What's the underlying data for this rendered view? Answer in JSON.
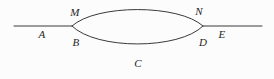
{
  "figure": {
    "kind": "graph-diagram",
    "background_color": "#fcfcfc",
    "stroke_color": "#3a3a3a",
    "stroke_width": 1
  },
  "geometry": {
    "left_vertex": {
      "x": 72,
      "y": 26
    },
    "right_vertex": {
      "x": 203,
      "y": 26
    },
    "left_line_start": {
      "x": 14,
      "y": 26
    },
    "right_line_end": {
      "x": 262,
      "y": 26
    },
    "upper_arc_apex": {
      "x": 138,
      "y": 5
    },
    "lower_arc_apex": {
      "x": 138,
      "y": 50
    },
    "upper_arc_path": "M 72 26 C 96 4, 179 4, 203 26",
    "lower_arc_path": "M 72 26 C 96 50, 179 50, 203 26",
    "left_line_path": "M 14 26 L 72 26",
    "right_line_path": "M 203 26 L 262 26"
  },
  "labels": [
    {
      "text": "A",
      "x": 42,
      "y": 34,
      "role": "left-segment-label"
    },
    {
      "text": "M",
      "x": 75,
      "y": 12,
      "role": "upper-arc-start-label"
    },
    {
      "text": "B",
      "x": 76,
      "y": 42,
      "role": "lower-arc-start-label"
    },
    {
      "text": "C",
      "x": 138,
      "y": 63,
      "role": "lower-arc-label"
    },
    {
      "text": "N",
      "x": 199,
      "y": 11,
      "role": "upper-arc-end-label"
    },
    {
      "text": "D",
      "x": 203,
      "y": 42,
      "role": "lower-arc-end-label"
    },
    {
      "text": "E",
      "x": 222,
      "y": 34,
      "role": "right-segment-label"
    }
  ]
}
